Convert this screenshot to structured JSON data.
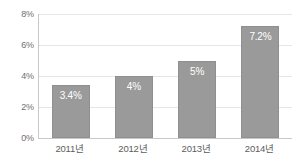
{
  "chart_data": {
    "type": "bar",
    "title": "",
    "xlabel": "",
    "ylabel": "",
    "categories": [
      "2011년",
      "2012년",
      "2013년",
      "2014년"
    ],
    "values": [
      3.4,
      4,
      5,
      7.2
    ],
    "data_labels": [
      "3.4%",
      "4%",
      "5%",
      "7.2%"
    ],
    "ylim": [
      0,
      8
    ],
    "ytick_values": [
      0,
      2,
      4,
      6,
      8
    ],
    "ytick_labels": [
      "0%",
      "2%",
      "4%",
      "6%",
      "8%"
    ],
    "grid": true,
    "legend": false,
    "legend_position": "none",
    "series": [
      {
        "name": "",
        "values": [
          3.4,
          4,
          5,
          7.2
        ]
      }
    ],
    "colors": {
      "bar_fill": "#9a9a9a",
      "bar_border": "#8f8f8f",
      "data_label_text": "#ffffff",
      "gridline": "#e6e6e6",
      "axis_line": "#c8c8c8",
      "tick_label_text": "#6f6f6f",
      "category_label_text": "#5d5d5d",
      "plot_background": "#ffffff"
    }
  }
}
